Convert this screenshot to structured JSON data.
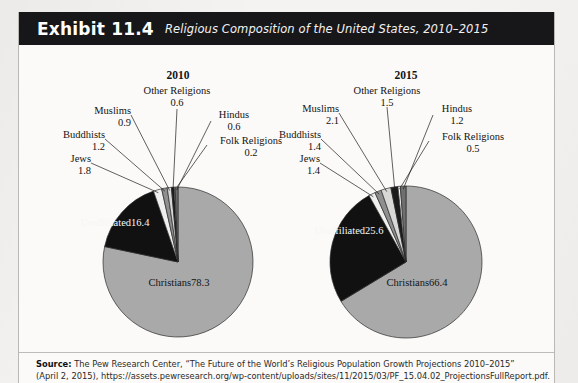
{
  "exhibit": {
    "label": "Exhibit 11.4",
    "title": "Religious Composition of the United States, 2010–2015"
  },
  "source": {
    "prefix": "Source:",
    "line1": " The Pew Research Center, “The Future of the World’s Religious Population Growth Projections 2010–2015”",
    "line2": "(April 2, 2015), https://assets.pewresearch.org/wp-content/uploads/sites/11/2015/03/PF_15.04.02_ProjectionsFullReport.pdf."
  },
  "colors": {
    "christians": "#a9a9a9",
    "unaffiliated": "#111111",
    "jews": "#f0f0ee",
    "buddhists": "#8f8f8f",
    "muslims": "#d8d8d6",
    "other_religions": "#1b1b1b",
    "folk_religions": "#ffffff",
    "hindus": "#6f6f6f",
    "outline": "#2b2b2b",
    "header_bar": "#17171a"
  },
  "chart_data": {
    "type": "pie",
    "title": "Religious Composition of the United States, 2010–2015",
    "unit": "percent",
    "charts": [
      {
        "panel_title": "2010",
        "categories": [
          "Christians",
          "Unaffiliated",
          "Jews",
          "Buddhists",
          "Muslims",
          "Other Religions",
          "Folk Religions",
          "Hindus"
        ],
        "values": [
          78.3,
          16.4,
          1.8,
          1.2,
          0.9,
          0.6,
          0.2,
          0.6
        ],
        "slices": [
          {
            "label": "Christians",
            "value": 78.3,
            "value_text": "78.3",
            "color_key": "christians",
            "placement": "inside"
          },
          {
            "label": "Unaffiliated",
            "value": 16.4,
            "value_text": "16.4",
            "color_key": "unaffiliated",
            "placement": "inside"
          },
          {
            "label": "Jews",
            "value": 1.8,
            "value_text": "1.8",
            "color_key": "jews",
            "placement": "callout"
          },
          {
            "label": "Buddhists",
            "value": 1.2,
            "value_text": "1.2",
            "color_key": "buddhists",
            "placement": "callout"
          },
          {
            "label": "Muslims",
            "value": 0.9,
            "value_text": "0.9",
            "color_key": "muslims",
            "placement": "callout"
          },
          {
            "label": "Other Religions",
            "value": 0.6,
            "value_text": "0.6",
            "color_key": "other_religions",
            "placement": "callout"
          },
          {
            "label": "Folk Religions",
            "value": 0.2,
            "value_text": "0.2",
            "color_key": "folk_religions",
            "placement": "callout"
          },
          {
            "label": "Hindus",
            "value": 0.6,
            "value_text": "0.6",
            "color_key": "hindus",
            "placement": "callout"
          }
        ]
      },
      {
        "panel_title": "2015",
        "categories": [
          "Christians",
          "Unaffiliated",
          "Jews",
          "Buddhists",
          "Muslims",
          "Other Religions",
          "Folk Religions",
          "Hindus"
        ],
        "values": [
          66.4,
          25.6,
          1.4,
          1.4,
          2.1,
          1.5,
          0.5,
          1.2
        ],
        "slices": [
          {
            "label": "Christians",
            "value": 66.4,
            "value_text": "66.4",
            "color_key": "christians",
            "placement": "inside"
          },
          {
            "label": "Unaffiliated",
            "value": 25.6,
            "value_text": "25.6",
            "color_key": "unaffiliated",
            "placement": "inside"
          },
          {
            "label": "Jews",
            "value": 1.4,
            "value_text": "1.4",
            "color_key": "jews",
            "placement": "callout"
          },
          {
            "label": "Buddhists",
            "value": 1.4,
            "value_text": "1.4",
            "color_key": "buddhists",
            "placement": "callout"
          },
          {
            "label": "Muslims",
            "value": 2.1,
            "value_text": "2.1",
            "color_key": "muslims",
            "placement": "callout"
          },
          {
            "label": "Other Religions",
            "value": 1.5,
            "value_text": "1.5",
            "color_key": "other_religions",
            "placement": "callout"
          },
          {
            "label": "Folk Religions",
            "value": 0.5,
            "value_text": "0.5",
            "color_key": "folk_religions",
            "placement": "callout"
          },
          {
            "label": "Hindus",
            "value": 1.2,
            "value_text": "1.2",
            "color_key": "hindus",
            "placement": "callout"
          }
        ]
      }
    ]
  }
}
